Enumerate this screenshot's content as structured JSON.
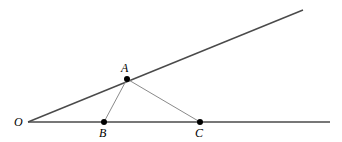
{
  "figure": {
    "type": "geometry-diagram",
    "width": 342,
    "height": 142,
    "background_color": "#ffffff"
  },
  "style": {
    "ray_color": "#4a4a4a",
    "segment_color": "#8a8a8a",
    "point_color": "#000000",
    "label_color": "#000000",
    "ray_width": 1.4,
    "segment_width": 1.0,
    "point_radius": 3.0
  },
  "points": [
    {
      "id": "O",
      "label": "O",
      "x": 28,
      "y": 122,
      "dot": false,
      "label_x": 14,
      "label_y": 116
    },
    {
      "id": "A",
      "label": "A",
      "x": 127,
      "y": 79,
      "dot": true,
      "label_x": 121,
      "label_y": 62
    },
    {
      "id": "B",
      "label": "B",
      "x": 104,
      "y": 122,
      "dot": true,
      "label_x": 99,
      "label_y": 127
    },
    {
      "id": "C",
      "label": "C",
      "x": 200,
      "y": 122,
      "dot": true,
      "label_x": 195,
      "label_y": 127
    }
  ],
  "rays": [
    {
      "id": "ray-OA",
      "name": "upper-ray",
      "from": "O",
      "through": "A",
      "x1": 28,
      "y1": 122,
      "x2": 303,
      "y2": 10
    },
    {
      "id": "ray-OC",
      "name": "horizontal-ray",
      "from": "O",
      "through": "C",
      "x1": 28,
      "y1": 122,
      "x2": 330,
      "y2": 122
    }
  ],
  "segments": [
    {
      "id": "segment-AB",
      "from": "A",
      "to": "B",
      "x1": 127,
      "y1": 79,
      "x2": 104,
      "y2": 122
    },
    {
      "id": "segment-AC",
      "from": "A",
      "to": "C",
      "x1": 127,
      "y1": 79,
      "x2": 200,
      "y2": 122
    }
  ]
}
